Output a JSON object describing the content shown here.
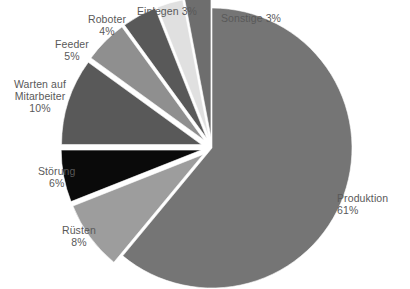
{
  "chart_data": {
    "type": "pie",
    "title": "",
    "subtitle": "",
    "xlabel": "",
    "ylabel": "",
    "legend_position": "none",
    "grid": false,
    "units": "percent",
    "label_format": "{name}\n{value}%",
    "categories": [
      "Produktion",
      "Rüsten",
      "Störung",
      "Warten auf Mitarbeiter",
      "Feeder",
      "Roboter",
      "Einlegen",
      "Sonstige"
    ],
    "values": [
      61,
      8,
      6,
      10,
      5,
      4,
      3,
      3
    ],
    "colors": [
      "#757575",
      "#9d9d9d",
      "#0a0a0a",
      "#595959",
      "#8f8f8f",
      "#595959",
      "#e0e0e0",
      "#6e6e6e"
    ],
    "exploded": [
      false,
      true,
      true,
      true,
      true,
      true,
      true,
      true
    ],
    "start_angle_deg": 0,
    "direction": "clockwise",
    "slices": [
      {
        "name": "Produktion",
        "value": 61,
        "value_text": "61%",
        "color": "#757575",
        "exploded": false,
        "label_lines": [
          "Produktion",
          "61%"
        ],
        "label_align": "right"
      },
      {
        "name": "Rüsten",
        "value": 8,
        "value_text": "8%",
        "color": "#9d9d9d",
        "exploded": true,
        "label_lines": [
          "Rüsten",
          "8%"
        ],
        "label_align": "center"
      },
      {
        "name": "Störung",
        "value": 6,
        "value_text": "6%",
        "color": "#0a0a0a",
        "exploded": true,
        "label_lines": [
          "Störung",
          "6%"
        ],
        "label_align": "center"
      },
      {
        "name": "Warten auf Mitarbeiter",
        "value": 10,
        "value_text": "10%",
        "color": "#595959",
        "exploded": true,
        "label_lines": [
          "Warten auf",
          "Mitarbeiter",
          "10%"
        ],
        "label_align": "center"
      },
      {
        "name": "Feeder",
        "value": 5,
        "value_text": "5%",
        "color": "#8f8f8f",
        "exploded": true,
        "label_lines": [
          "Feeder",
          "5%"
        ],
        "label_align": "center"
      },
      {
        "name": "Roboter",
        "value": 4,
        "value_text": "4%",
        "color": "#595959",
        "exploded": true,
        "label_lines": [
          "Roboter",
          "4%"
        ],
        "label_align": "center"
      },
      {
        "name": "Einlegen",
        "value": 3,
        "value_text": "3%",
        "color": "#e0e0e0",
        "exploded": true,
        "label_lines": [
          "Einlegen 3%"
        ],
        "label_align": "center"
      },
      {
        "name": "Sonstige",
        "value": 3,
        "value_text": "3%",
        "color": "#6e6e6e",
        "exploded": true,
        "label_lines": [
          "Sonstige 3%"
        ],
        "label_align": "left"
      }
    ]
  },
  "labels": {
    "produktion": {
      "line1": "Produktion",
      "line2": "61%"
    },
    "ruesten": {
      "line1": "Rüsten",
      "line2": "8%"
    },
    "stoerung": {
      "line1": "Störung",
      "line2": "6%"
    },
    "warten": {
      "line1": "Warten auf",
      "line2": "Mitarbeiter",
      "line3": "10%"
    },
    "feeder": {
      "line1": "Feeder",
      "line2": "5%"
    },
    "roboter": {
      "line1": "Roboter",
      "line2": "4%"
    },
    "einlegen": {
      "line1": "Einlegen 3%"
    },
    "sonstige": {
      "line1": "Sonstige 3%"
    }
  },
  "style": {
    "background": "#ffffff",
    "text_color": "#595959",
    "slice_gap_color": "#ffffff"
  }
}
